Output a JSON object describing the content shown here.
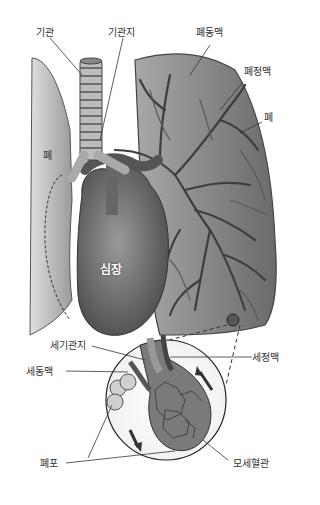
{
  "labels": {
    "trachea": "기관",
    "bronchus": "기관지",
    "pulmonary_artery": "폐동맥",
    "pulmonary_vein": "폐정맥",
    "lung_right_side": "폐",
    "lung_left_side": "폐",
    "heart": "심장",
    "bronchiole": "세기관지",
    "venule": "세정맥",
    "arteriole": "세동맥",
    "alveolus": "폐포",
    "capillary": "모세혈관"
  },
  "colors": {
    "lung_fill": "#8f8f8f",
    "lung_light": "#c9c9c9",
    "heart_fill": "#6e6e6e",
    "vessel": "#4a4a4a",
    "line": "#333333"
  }
}
